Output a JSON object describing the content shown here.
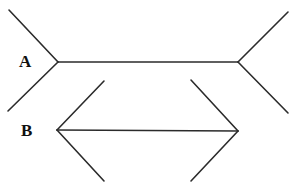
{
  "figure": {
    "width": 294,
    "height": 183,
    "background_color": "#ffffff",
    "line_color": "#2b2b2b",
    "line_width": 1.6
  },
  "labels": {
    "a": "A",
    "b": "B"
  },
  "chart_data": {
    "type": "diagram",
    "figures": [
      {
        "name": "A",
        "label": "A",
        "fin_direction": "outward",
        "shaft": {
          "x1": 58,
          "y1": 62,
          "x2": 238,
          "y2": 62,
          "length": 180
        },
        "fins": [
          {
            "name": "a-top-left-fin",
            "x1": 58,
            "y1": 62,
            "x2": 9,
            "y2": 10
          },
          {
            "name": "a-bottom-left-fin",
            "x1": 58,
            "y1": 62,
            "x2": 8,
            "y2": 111
          },
          {
            "name": "a-top-right-fin",
            "x1": 238,
            "y1": 62,
            "x2": 288,
            "y2": 12
          },
          {
            "name": "a-bottom-right-fin",
            "x1": 238,
            "y1": 62,
            "x2": 288,
            "y2": 113
          }
        ]
      },
      {
        "name": "B",
        "label": "B",
        "fin_direction": "inward",
        "shaft": {
          "x1": 57,
          "y1": 130,
          "x2": 238,
          "y2": 131,
          "length": 181
        },
        "fins": [
          {
            "name": "b-top-left-fin",
            "x1": 57,
            "y1": 130,
            "x2": 104,
            "y2": 81
          },
          {
            "name": "b-bottom-left-fin",
            "x1": 57,
            "y1": 130,
            "x2": 104,
            "y2": 181
          },
          {
            "name": "b-top-right-fin",
            "x1": 238,
            "y1": 131,
            "x2": 191,
            "y2": 80
          },
          {
            "name": "b-bottom-right-fin",
            "x1": 238,
            "y1": 131,
            "x2": 191,
            "y2": 181
          }
        ]
      }
    ]
  }
}
